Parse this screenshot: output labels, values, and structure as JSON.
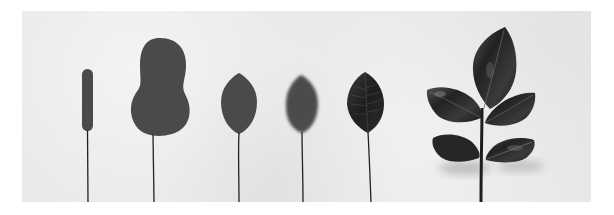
{
  "image": {
    "description": "Photograph of six leaf models on a textured light-grey paper background, arranged left to right by increasing level of detail: a thin elongated blob, a rounded peanut-shaped blob, a smooth oval leaf, a blurred oval leaf, a dark veined leaf, and a realistic compound leaf sprig with five leaflets.",
    "background_color": "#e8e8e8",
    "page_color": "#ffffff",
    "leaf_color_flat": "#4a4a4a",
    "leaf_color_dark": "#2a2a2a",
    "stem_color": "#222222",
    "objects": [
      {
        "name": "elongated-blob-leaf",
        "shape": "thin capsule"
      },
      {
        "name": "peanut-blob-leaf",
        "shape": "rounded two-lobed blob"
      },
      {
        "name": "smooth-oval-leaf",
        "shape": "pointed oval, flat grey"
      },
      {
        "name": "blurred-oval-leaf",
        "shape": "pointed oval, soft blurred edges"
      },
      {
        "name": "veined-dark-leaf",
        "shape": "pointed oval with visible veins"
      },
      {
        "name": "compound-leaf-sprig",
        "shape": "stem with five leaflets and shadows"
      }
    ]
  }
}
